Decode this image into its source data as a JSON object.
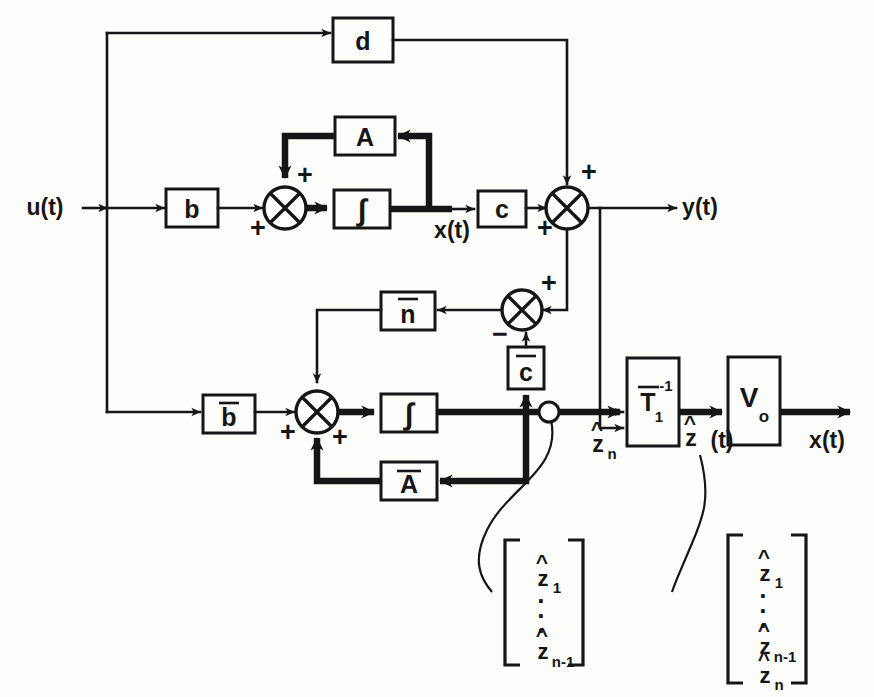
{
  "diagram": {
    "type": "control-system-block-diagram",
    "width": 874,
    "height": 697,
    "line_color": "#161616",
    "background": "#fdfdfc"
  },
  "blocks": [
    {
      "id": "d",
      "label": "d",
      "overbar": false,
      "sub": "",
      "sup": "",
      "x": 333,
      "y": 18,
      "w": 60,
      "h": 44
    },
    {
      "id": "A",
      "label": "A",
      "overbar": false,
      "sub": "",
      "sup": "",
      "x": 335,
      "y": 117,
      "w": 60,
      "h": 38
    },
    {
      "id": "b",
      "label": "b",
      "overbar": false,
      "sub": "",
      "sup": "",
      "x": 166,
      "y": 189,
      "w": 52,
      "h": 38
    },
    {
      "id": "int1",
      "label": "∫",
      "overbar": false,
      "sub": "",
      "sup": "",
      "x": 334,
      "y": 190,
      "w": 56,
      "h": 38
    },
    {
      "id": "c",
      "label": "c",
      "overbar": false,
      "sub": "",
      "sup": "",
      "x": 478,
      "y": 191,
      "w": 48,
      "h": 36
    },
    {
      "id": "nbar",
      "label": "n",
      "overbar": true,
      "sub": "",
      "sup": "",
      "x": 381,
      "y": 292,
      "w": 54,
      "h": 38
    },
    {
      "id": "cbar",
      "label": "c",
      "overbar": true,
      "sub": "",
      "sup": "",
      "x": 508,
      "y": 347,
      "w": 36,
      "h": 42
    },
    {
      "id": "bbar",
      "label": "b",
      "overbar": true,
      "sub": "",
      "sup": "",
      "x": 203,
      "y": 395,
      "w": 52,
      "h": 38
    },
    {
      "id": "int2",
      "label": "∫",
      "overbar": false,
      "sub": "",
      "sup": "",
      "x": 381,
      "y": 394,
      "w": 56,
      "h": 38
    },
    {
      "id": "Abar",
      "label": "A",
      "overbar": true,
      "sub": "",
      "sup": "",
      "x": 381,
      "y": 462,
      "w": 56,
      "h": 38
    },
    {
      "id": "Tinv",
      "label": "T",
      "overbar": true,
      "sub": "1",
      "sup": "-1",
      "x": 627,
      "y": 358,
      "w": 52,
      "h": 88
    },
    {
      "id": "V0",
      "label": "V",
      "overbar": false,
      "sub": "o",
      "sup": "",
      "x": 728,
      "y": 357,
      "w": 52,
      "h": 88
    }
  ],
  "junctions": [
    {
      "id": "sum-plant",
      "cx": 285,
      "cy": 208,
      "r": 21
    },
    {
      "id": "sum-output",
      "cx": 567,
      "cy": 208,
      "r": 21
    },
    {
      "id": "sum-error",
      "cx": 522,
      "cy": 310,
      "r": 20
    },
    {
      "id": "sum-obs",
      "cx": 317,
      "cy": 412,
      "r": 21
    }
  ],
  "signs": [
    {
      "id": "sign-plant-top",
      "text": "+",
      "x": 305,
      "y": 175
    },
    {
      "id": "sign-plant-left",
      "text": "+",
      "x": 258,
      "y": 228
    },
    {
      "id": "sign-output-top",
      "text": "+",
      "x": 589,
      "y": 172
    },
    {
      "id": "sign-output-left",
      "text": "+",
      "x": 545,
      "y": 228
    },
    {
      "id": "sign-error-top",
      "text": "+",
      "x": 549,
      "y": 283
    },
    {
      "id": "sign-error-bot",
      "text": "−",
      "x": 500,
      "y": 334
    },
    {
      "id": "sign-obs-left",
      "text": "+",
      "x": 288,
      "y": 432
    },
    {
      "id": "sign-obs-bot",
      "text": "+",
      "x": 340,
      "y": 437
    }
  ],
  "signals": [
    {
      "id": "input",
      "text": "u(t)",
      "x": 45,
      "y": 207
    },
    {
      "id": "state",
      "text": "x(t)",
      "x": 452,
      "y": 228
    },
    {
      "id": "output",
      "text": "y(t)",
      "x": 700,
      "y": 207
    },
    {
      "id": "state-est",
      "text": "x(t)",
      "x": 827,
      "y": 440
    }
  ],
  "hat_signals": [
    {
      "id": "z-n",
      "base": "z",
      "sub": "n",
      "paren": "",
      "x": 598,
      "y": 430
    },
    {
      "id": "z-hat-t",
      "base": "z",
      "sub": "",
      "paren": "(t)",
      "x": 692,
      "y": 438
    }
  ],
  "vectors": [
    {
      "id": "vector-left",
      "x": 505,
      "y": 537,
      "w": 78,
      "h": 128,
      "entries": [
        "z1",
        "dots",
        "z_n-1"
      ],
      "rows": [
        {
          "base": "z",
          "sub": "1"
        },
        {
          "base": "",
          "sub": ""
        },
        {
          "base": "z",
          "sub": "n-1"
        }
      ]
    },
    {
      "id": "vector-right",
      "x": 728,
      "y": 532,
      "w": 78,
      "h": 152,
      "entries": [
        "z1",
        "dots",
        "z_n-1",
        "zn"
      ],
      "rows": [
        {
          "base": "z",
          "sub": "1"
        },
        {
          "base": "",
          "sub": ""
        },
        {
          "base": "z",
          "sub": "n-1"
        },
        {
          "base": "z",
          "sub": "n"
        }
      ]
    }
  ],
  "dots_glyph": "·",
  "labels": {
    "plant_loop": "A",
    "observer_loop": "A-bar",
    "integrator_glyph": "∫"
  }
}
